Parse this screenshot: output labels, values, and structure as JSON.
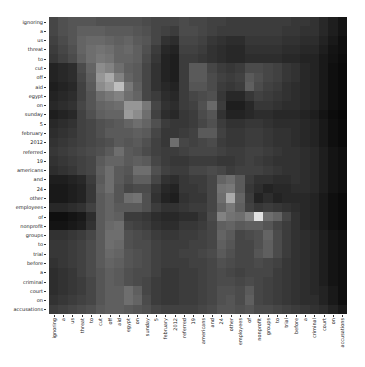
{
  "chart_data": {
    "type": "heatmap",
    "title": "",
    "xlabel": "",
    "ylabel": "",
    "colormap": "gray",
    "value_range": [
      0,
      255
    ],
    "x_labels": [
      "ignoring",
      "a",
      "us",
      "threat",
      "to",
      "cut",
      "off",
      "aid",
      "egypt",
      "on",
      "sunday",
      "5",
      "february",
      "2012",
      "referred",
      "19",
      "americans",
      "and",
      "24",
      "other",
      "employees",
      "of",
      "nonprofit",
      "groups",
      "to",
      "trial",
      "before",
      "a",
      "criminal",
      "court",
      "on",
      "accusations"
    ],
    "y_labels": [
      "ignoring",
      "a",
      "us",
      "threat",
      "to",
      "cut",
      "off",
      "aid",
      "egypt",
      "on",
      "sunday",
      "5",
      "february",
      "2012",
      "referred",
      "19",
      "americans",
      "and",
      "24",
      "other",
      "employees",
      "of",
      "nonprofit",
      "groups",
      "to",
      "trial",
      "before",
      "a",
      "criminal",
      "court",
      "on",
      "accusations"
    ],
    "values": [
      [
        70,
        80,
        85,
        85,
        85,
        80,
        80,
        80,
        80,
        80,
        75,
        70,
        70,
        70,
        75,
        70,
        70,
        65,
        65,
        60,
        60,
        60,
        60,
        60,
        60,
        60,
        55,
        55,
        50,
        40,
        30,
        20
      ],
      [
        70,
        80,
        85,
        95,
        95,
        95,
        90,
        90,
        90,
        85,
        80,
        70,
        65,
        60,
        75,
        75,
        70,
        65,
        60,
        60,
        60,
        60,
        60,
        60,
        60,
        55,
        55,
        50,
        50,
        40,
        30,
        20
      ],
      [
        65,
        75,
        85,
        100,
        105,
        105,
        100,
        95,
        100,
        90,
        85,
        70,
        50,
        45,
        70,
        70,
        65,
        55,
        50,
        45,
        45,
        55,
        55,
        55,
        55,
        50,
        50,
        45,
        45,
        35,
        25,
        15
      ],
      [
        60,
        70,
        80,
        100,
        110,
        115,
        110,
        100,
        105,
        95,
        80,
        60,
        40,
        35,
        65,
        65,
        60,
        50,
        45,
        40,
        40,
        50,
        50,
        50,
        50,
        45,
        45,
        40,
        40,
        30,
        20,
        15
      ],
      [
        55,
        65,
        75,
        95,
        110,
        120,
        115,
        100,
        100,
        95,
        75,
        55,
        35,
        30,
        60,
        60,
        55,
        50,
        45,
        40,
        40,
        45,
        45,
        45,
        45,
        40,
        40,
        35,
        35,
        25,
        18,
        12
      ],
      [
        35,
        40,
        45,
        75,
        100,
        140,
        130,
        110,
        95,
        90,
        70,
        50,
        35,
        30,
        60,
        90,
        90,
        70,
        60,
        55,
        60,
        75,
        75,
        70,
        65,
        55,
        50,
        40,
        35,
        25,
        15,
        10
      ],
      [
        35,
        40,
        45,
        70,
        95,
        150,
        170,
        130,
        100,
        90,
        70,
        50,
        35,
        30,
        60,
        90,
        90,
        75,
        65,
        60,
        65,
        90,
        80,
        70,
        65,
        55,
        50,
        40,
        35,
        25,
        15,
        10
      ],
      [
        30,
        35,
        40,
        65,
        90,
        140,
        155,
        190,
        120,
        95,
        70,
        50,
        40,
        35,
        60,
        85,
        85,
        75,
        60,
        55,
        60,
        95,
        75,
        65,
        60,
        50,
        45,
        40,
        35,
        25,
        15,
        10
      ],
      [
        35,
        40,
        45,
        65,
        85,
        110,
        120,
        130,
        110,
        100,
        70,
        60,
        45,
        40,
        60,
        70,
        75,
        80,
        55,
        40,
        40,
        55,
        65,
        60,
        55,
        50,
        45,
        40,
        35,
        25,
        15,
        10
      ],
      [
        40,
        45,
        50,
        70,
        85,
        100,
        105,
        110,
        150,
        150,
        120,
        70,
        50,
        45,
        60,
        65,
        80,
        105,
        60,
        30,
        30,
        40,
        55,
        55,
        50,
        45,
        45,
        40,
        35,
        25,
        15,
        10
      ],
      [
        30,
        35,
        40,
        65,
        80,
        95,
        100,
        100,
        155,
        140,
        110,
        65,
        45,
        40,
        55,
        60,
        75,
        85,
        50,
        35,
        35,
        40,
        45,
        45,
        40,
        40,
        40,
        35,
        30,
        20,
        12,
        8
      ],
      [
        40,
        45,
        50,
        65,
        70,
        80,
        85,
        90,
        100,
        110,
        100,
        80,
        60,
        55,
        55,
        60,
        70,
        80,
        60,
        50,
        50,
        55,
        55,
        50,
        45,
        45,
        45,
        40,
        35,
        25,
        15,
        10
      ],
      [
        45,
        50,
        55,
        65,
        70,
        80,
        90,
        90,
        90,
        95,
        90,
        70,
        55,
        55,
        60,
        65,
        90,
        90,
        65,
        55,
        55,
        60,
        60,
        55,
        50,
        50,
        45,
        40,
        35,
        25,
        15,
        10
      ],
      [
        50,
        55,
        60,
        65,
        70,
        75,
        80,
        90,
        85,
        90,
        80,
        65,
        55,
        110,
        70,
        65,
        70,
        75,
        60,
        55,
        55,
        60,
        60,
        55,
        50,
        50,
        45,
        40,
        35,
        25,
        15,
        10
      ],
      [
        55,
        60,
        65,
        70,
        75,
        80,
        90,
        110,
        90,
        85,
        75,
        65,
        60,
        60,
        65,
        70,
        70,
        70,
        65,
        60,
        60,
        65,
        65,
        60,
        55,
        50,
        50,
        45,
        40,
        30,
        20,
        15
      ],
      [
        50,
        55,
        60,
        65,
        70,
        90,
        100,
        100,
        90,
        95,
        90,
        70,
        60,
        55,
        55,
        60,
        60,
        60,
        55,
        55,
        60,
        65,
        60,
        55,
        50,
        50,
        50,
        45,
        40,
        30,
        20,
        15
      ],
      [
        45,
        50,
        55,
        65,
        70,
        95,
        110,
        90,
        85,
        110,
        110,
        80,
        65,
        60,
        60,
        70,
        70,
        75,
        70,
        60,
        65,
        65,
        65,
        60,
        55,
        50,
        50,
        45,
        40,
        30,
        20,
        15
      ],
      [
        30,
        30,
        35,
        40,
        60,
        90,
        110,
        90,
        80,
        95,
        95,
        70,
        50,
        45,
        55,
        60,
        60,
        70,
        100,
        110,
        90,
        60,
        50,
        50,
        45,
        45,
        50,
        45,
        40,
        30,
        20,
        15
      ],
      [
        25,
        25,
        30,
        35,
        55,
        95,
        110,
        85,
        70,
        75,
        75,
        55,
        40,
        35,
        55,
        55,
        60,
        70,
        115,
        120,
        90,
        55,
        45,
        35,
        40,
        40,
        45,
        45,
        40,
        30,
        20,
        15
      ],
      [
        25,
        25,
        30,
        35,
        55,
        90,
        100,
        85,
        110,
        115,
        80,
        50,
        35,
        30,
        50,
        55,
        55,
        70,
        110,
        170,
        100,
        60,
        35,
        45,
        35,
        40,
        40,
        40,
        35,
        25,
        15,
        10
      ],
      [
        40,
        40,
        45,
        50,
        65,
        90,
        100,
        90,
        90,
        90,
        80,
        60,
        50,
        50,
        55,
        60,
        60,
        70,
        100,
        120,
        95,
        65,
        55,
        60,
        55,
        50,
        45,
        40,
        35,
        25,
        15,
        10
      ],
      [
        15,
        15,
        20,
        25,
        45,
        90,
        100,
        95,
        60,
        60,
        55,
        45,
        40,
        40,
        45,
        45,
        55,
        75,
        130,
        115,
        110,
        130,
        225,
        110,
        100,
        70,
        50,
        40,
        35,
        25,
        15,
        10
      ],
      [
        20,
        20,
        25,
        30,
        50,
        90,
        105,
        110,
        70,
        65,
        60,
        50,
        45,
        45,
        55,
        55,
        60,
        70,
        95,
        100,
        90,
        95,
        95,
        85,
        70,
        60,
        50,
        40,
        35,
        25,
        15,
        10
      ],
      [
        50,
        50,
        55,
        60,
        70,
        90,
        110,
        110,
        80,
        75,
        70,
        60,
        55,
        55,
        60,
        60,
        65,
        70,
        100,
        90,
        70,
        75,
        80,
        100,
        75,
        60,
        50,
        45,
        40,
        30,
        20,
        15
      ],
      [
        55,
        55,
        60,
        65,
        75,
        90,
        110,
        105,
        80,
        75,
        75,
        65,
        60,
        60,
        60,
        65,
        65,
        70,
        95,
        85,
        70,
        70,
        80,
        95,
        75,
        60,
        50,
        45,
        40,
        30,
        20,
        15
      ],
      [
        55,
        55,
        60,
        65,
        75,
        90,
        105,
        100,
        85,
        80,
        75,
        65,
        60,
        60,
        65,
        65,
        70,
        75,
        90,
        80,
        70,
        70,
        85,
        95,
        75,
        60,
        50,
        45,
        40,
        30,
        20,
        15
      ],
      [
        50,
        55,
        60,
        65,
        75,
        90,
        100,
        95,
        85,
        80,
        75,
        65,
        60,
        60,
        60,
        65,
        65,
        70,
        80,
        75,
        70,
        70,
        75,
        70,
        65,
        55,
        50,
        45,
        40,
        30,
        20,
        15
      ],
      [
        45,
        50,
        55,
        65,
        75,
        85,
        95,
        90,
        80,
        75,
        75,
        65,
        55,
        55,
        60,
        60,
        65,
        70,
        75,
        70,
        65,
        70,
        70,
        70,
        60,
        55,
        50,
        45,
        40,
        30,
        20,
        15
      ],
      [
        45,
        50,
        55,
        60,
        70,
        85,
        95,
        90,
        80,
        75,
        70,
        60,
        55,
        55,
        60,
        60,
        65,
        70,
        75,
        75,
        70,
        75,
        70,
        65,
        60,
        55,
        50,
        45,
        40,
        30,
        20,
        15
      ],
      [
        45,
        50,
        55,
        60,
        70,
        85,
        95,
        95,
        110,
        95,
        70,
        60,
        55,
        55,
        60,
        60,
        65,
        70,
        80,
        80,
        75,
        90,
        70,
        65,
        60,
        55,
        50,
        45,
        40,
        35,
        25,
        15
      ],
      [
        50,
        55,
        60,
        65,
        70,
        85,
        95,
        95,
        110,
        100,
        75,
        60,
        55,
        55,
        60,
        60,
        65,
        70,
        80,
        85,
        75,
        95,
        70,
        65,
        60,
        55,
        50,
        45,
        45,
        35,
        25,
        15
      ],
      [
        60,
        65,
        70,
        75,
        80,
        90,
        95,
        95,
        90,
        85,
        80,
        70,
        65,
        65,
        65,
        65,
        70,
        75,
        85,
        85,
        80,
        85,
        75,
        75,
        70,
        65,
        60,
        55,
        50,
        45,
        35,
        25
      ]
    ]
  }
}
